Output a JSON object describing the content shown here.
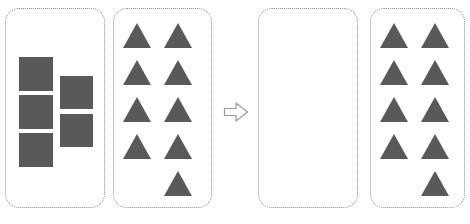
{
  "diagram": {
    "operator_icon": "right-arrow-icon",
    "shape_color": "#595959",
    "panel_border_color": "#8c8c8c",
    "background_color": "#ffffff",
    "panels": [
      {
        "id": "squares-left",
        "role": "minuend-group-squares",
        "shape": "square",
        "count": 5,
        "layout": "two-column-staggered",
        "items": [
          {
            "shape": "square",
            "column": 1,
            "row": 1
          },
          {
            "shape": "square",
            "column": 1,
            "row": 2
          },
          {
            "shape": "square",
            "column": 1,
            "row": 3
          },
          {
            "shape": "square",
            "column": 2,
            "row": 1
          },
          {
            "shape": "square",
            "column": 2,
            "row": 2
          }
        ]
      },
      {
        "id": "triangles-left",
        "role": "minuend-group-triangles",
        "shape": "triangle",
        "count": 9,
        "layout": "two-column-grid",
        "items": [
          {
            "shape": "triangle",
            "column": 1,
            "row": 1
          },
          {
            "shape": "triangle",
            "column": 2,
            "row": 1
          },
          {
            "shape": "triangle",
            "column": 1,
            "row": 2
          },
          {
            "shape": "triangle",
            "column": 2,
            "row": 2
          },
          {
            "shape": "triangle",
            "column": 1,
            "row": 3
          },
          {
            "shape": "triangle",
            "column": 2,
            "row": 3
          },
          {
            "shape": "triangle",
            "column": 1,
            "row": 4
          },
          {
            "shape": "triangle",
            "column": 2,
            "row": 4
          },
          {
            "shape": "triangle",
            "column": 2,
            "row": 5
          }
        ]
      },
      {
        "id": "empty-right",
        "role": "result-group-squares",
        "shape": "square",
        "count": 0,
        "layout": "empty",
        "items": []
      },
      {
        "id": "triangles-right",
        "role": "result-group-triangles",
        "shape": "triangle",
        "count": 9,
        "layout": "two-column-grid",
        "items": [
          {
            "shape": "triangle",
            "column": 1,
            "row": 1
          },
          {
            "shape": "triangle",
            "column": 2,
            "row": 1
          },
          {
            "shape": "triangle",
            "column": 1,
            "row": 2
          },
          {
            "shape": "triangle",
            "column": 2,
            "row": 2
          },
          {
            "shape": "triangle",
            "column": 1,
            "row": 3
          },
          {
            "shape": "triangle",
            "column": 2,
            "row": 3
          },
          {
            "shape": "triangle",
            "column": 1,
            "row": 4
          },
          {
            "shape": "triangle",
            "column": 2,
            "row": 4
          },
          {
            "shape": "triangle",
            "column": 2,
            "row": 5
          }
        ]
      }
    ]
  }
}
